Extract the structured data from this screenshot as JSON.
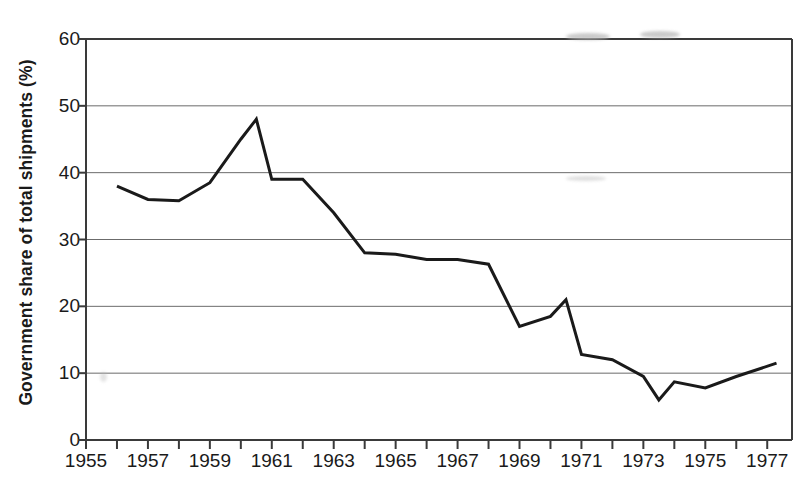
{
  "chart_data": {
    "type": "line",
    "title": "",
    "xlabel": "",
    "ylabel": "Government share of  total shipments (%)",
    "ylim": [
      0,
      60
    ],
    "xlim": [
      1955,
      1977.8
    ],
    "yticks": [
      0,
      10,
      20,
      30,
      40,
      50,
      60
    ],
    "ytick_labels": [
      "0",
      "10",
      "20",
      "30",
      "40",
      "50",
      "60"
    ],
    "xticks": [
      1955,
      1957,
      1959,
      1961,
      1963,
      1965,
      1967,
      1969,
      1971,
      1973,
      1975,
      1977
    ],
    "xtick_labels": [
      "1955",
      "1957",
      "1959",
      "1961",
      "1963",
      "1965",
      "1967",
      "1969",
      "1971",
      "1973",
      "1975",
      "1977"
    ],
    "x_minor_ticks": [
      1956,
      1958,
      1960,
      1962,
      1964,
      1966,
      1968,
      1970,
      1972,
      1974,
      1976
    ],
    "grid": "horizontal",
    "legend": "none",
    "line_color": "#1a1a1a",
    "line_width": 3,
    "x": [
      1956,
      1957,
      1958,
      1959,
      1960,
      1960.5,
      1961,
      1962,
      1963,
      1964,
      1965,
      1966,
      1967,
      1968,
      1969,
      1970,
      1970.5,
      1971,
      1972,
      1973,
      1973.5,
      1974,
      1975,
      1976,
      1977.3
    ],
    "values": [
      38,
      36,
      35.8,
      38.5,
      45,
      48,
      39,
      39,
      34,
      28,
      27.8,
      27,
      27,
      26.3,
      17,
      18.5,
      21,
      12.8,
      12,
      9.5,
      6,
      8.7,
      7.8,
      9.5,
      11.5
    ],
    "series": [
      {
        "name": "Government share of total shipments",
        "points": [
          {
            "year": 1956,
            "value": 38
          },
          {
            "year": 1957,
            "value": 36
          },
          {
            "year": 1958,
            "value": 35.8
          },
          {
            "year": 1959,
            "value": 38.5
          },
          {
            "year": 1960,
            "value": 45
          },
          {
            "year": 1960.5,
            "value": 48
          },
          {
            "year": 1961,
            "value": 39
          },
          {
            "year": 1962,
            "value": 39
          },
          {
            "year": 1963,
            "value": 34
          },
          {
            "year": 1964,
            "value": 28
          },
          {
            "year": 1965,
            "value": 27.8
          },
          {
            "year": 1966,
            "value": 27
          },
          {
            "year": 1967,
            "value": 27
          },
          {
            "year": 1968,
            "value": 26.3
          },
          {
            "year": 1969,
            "value": 17
          },
          {
            "year": 1970,
            "value": 18.5
          },
          {
            "year": 1970.5,
            "value": 21
          },
          {
            "year": 1971,
            "value": 12.8
          },
          {
            "year": 1972,
            "value": 12
          },
          {
            "year": 1973,
            "value": 9.5
          },
          {
            "year": 1973.5,
            "value": 6
          },
          {
            "year": 1974,
            "value": 8.7
          },
          {
            "year": 1975,
            "value": 7.8
          },
          {
            "year": 1976,
            "value": 9.5
          },
          {
            "year": 1977.3,
            "value": 11.5
          }
        ]
      }
    ]
  }
}
